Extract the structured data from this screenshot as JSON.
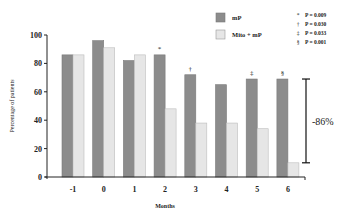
{
  "chart_data": {
    "type": "bar",
    "title": "",
    "xlabel": "Months",
    "ylabel": "Percentage of patients",
    "ylim": [
      0,
      100
    ],
    "yticks": [
      0,
      20,
      40,
      60,
      80,
      100
    ],
    "categories": [
      "-1",
      "0",
      "1",
      "2",
      "3",
      "4",
      "5",
      "6"
    ],
    "series": [
      {
        "name": "mP",
        "color": "#8c8c8c",
        "values": [
          86,
          96,
          82,
          86,
          72,
          65,
          69,
          69
        ]
      },
      {
        "name": "Mito + mP",
        "color": "#e6e6e6",
        "values": [
          86,
          91,
          86,
          48,
          38,
          38,
          34,
          10
        ]
      }
    ],
    "significance_marks": [
      {
        "category": "2",
        "symbol": "*"
      },
      {
        "category": "3",
        "symbol": "†"
      },
      {
        "category": "5",
        "symbol": "‡"
      },
      {
        "category": "6",
        "symbol": "§"
      }
    ],
    "pvalue_legend": [
      {
        "symbol": "*",
        "text": "P = 0.009"
      },
      {
        "symbol": "†",
        "text": "P = 0.030"
      },
      {
        "symbol": "‡",
        "text": "P = 0.033"
      },
      {
        "symbol": "§",
        "text": "P = 0.001"
      }
    ],
    "annotation": {
      "text": "-86%",
      "from_value": 69,
      "to_value": 10
    },
    "grid": false,
    "legend_position": "top-right"
  }
}
